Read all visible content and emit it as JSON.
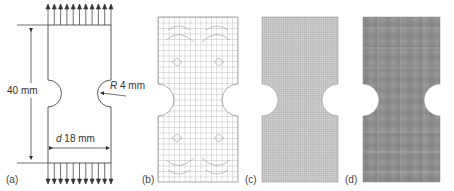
{
  "figure": {
    "panels": [
      {
        "id": "a",
        "label": "(a)",
        "type": "geometry-drawing"
      },
      {
        "id": "b",
        "label": "(b)",
        "type": "coarse-unstructured-mesh"
      },
      {
        "id": "c",
        "label": "(c)",
        "type": "fine-structured-mesh"
      },
      {
        "id": "d",
        "label": "(d)",
        "type": "very-fine-mesh"
      }
    ],
    "dimensions": {
      "height": "40 mm",
      "radius_symbol": "R",
      "radius_value": "4 mm",
      "width_symbol": "d",
      "width_value": "18 mm"
    },
    "loading": {
      "top_arrows": 11,
      "bottom_arrows": 11,
      "direction": "tension"
    },
    "colors": {
      "line": "#333333",
      "mesh_b": "#9a9a9a",
      "mesh_c": "#8a8a8a",
      "mesh_d": "#777777"
    }
  }
}
